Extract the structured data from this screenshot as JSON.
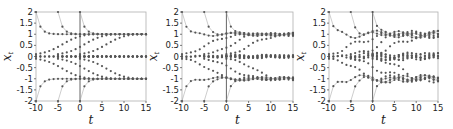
{
  "figure": {
    "panels": 3,
    "marker_color": "#555555",
    "line_color": "#9a9a9a",
    "frame_color": "#b0b0b0",
    "vline_color": "#555555"
  },
  "chart_data": [
    {
      "type": "scatter",
      "title": "",
      "xlabel": "t",
      "ylabel": "x_t",
      "xlim": [
        -10,
        15
      ],
      "ylim": [
        -2,
        2
      ],
      "xticks": [
        -10,
        -5,
        0,
        5,
        10,
        15
      ],
      "xtick_labels": [
        "-10",
        "-5",
        "0",
        "5",
        "10",
        "15"
      ],
      "yticks": [
        2,
        1.5,
        1,
        0.5,
        0,
        -0.5,
        -1,
        -1.5,
        -2
      ],
      "ytick_labels": [
        "2",
        "1.5",
        "1",
        "0.5",
        "0",
        "-0.5",
        "-1",
        "-1.5",
        "-2"
      ],
      "vertical_line_at": 0,
      "grid": false,
      "description": "Trajectories converging to attractors at -1, 0, 1 with smooth branching; starting points at t=-10,-5,0 from y=±2 and y=0",
      "noise": 0.0,
      "starts": [
        -10,
        -5,
        0
      ],
      "attractors": [
        1,
        0,
        -1
      ]
    },
    {
      "type": "scatter",
      "title": "",
      "xlabel": "t",
      "ylabel": "x_t",
      "xlim": [
        -10,
        15
      ],
      "ylim": [
        -2,
        2
      ],
      "xticks": [
        -10,
        -5,
        0,
        5,
        10,
        15
      ],
      "xtick_labels": [
        "-10",
        "-5",
        "0",
        "5",
        "10",
        "15"
      ],
      "yticks": [
        2,
        1.5,
        1,
        0.5,
        0,
        -0.5,
        -1,
        -1.5,
        -2
      ],
      "ytick_labels": [
        "2",
        "1.5",
        "1",
        "0.5",
        "0",
        "-0.5",
        "-1",
        "-1.5",
        "-2"
      ],
      "vertical_line_at": 0,
      "grid": false,
      "description": "Trajectories with mild oscillation around attractors at -1, 0, 1",
      "noise": 0.05,
      "starts": [
        -10,
        -5,
        0
      ],
      "attractors": [
        1,
        0,
        -1
      ]
    },
    {
      "type": "scatter",
      "title": "",
      "xlabel": "t",
      "ylabel": "x_t",
      "xlim": [
        -10,
        15
      ],
      "ylim": [
        -2,
        2
      ],
      "xticks": [
        -10,
        -5,
        0,
        5,
        10,
        15
      ],
      "xtick_labels": [
        "-10",
        "-5",
        "0",
        "5",
        "10",
        "15"
      ],
      "yticks": [
        2,
        1.5,
        1,
        0.5,
        0,
        -0.5,
        -1,
        -1.5,
        -2
      ],
      "ytick_labels": [
        "2",
        "1.5",
        "1",
        "0.5",
        "0",
        "-0.5",
        "-1",
        "-1.5",
        "-2"
      ],
      "vertical_line_at": 0,
      "grid": false,
      "description": "Trajectories with larger wavy oscillation around attractors at -1, 0, 1",
      "noise": 0.11,
      "starts": [
        -10,
        -5,
        0
      ],
      "attractors": [
        1,
        0,
        -1
      ]
    }
  ]
}
